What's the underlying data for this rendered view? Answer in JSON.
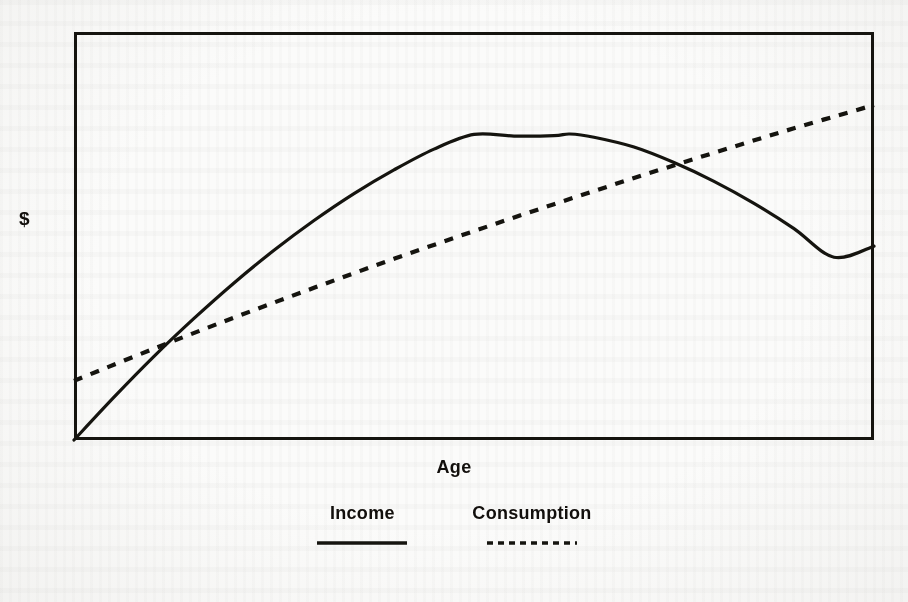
{
  "figure": {
    "background_color": "#fbfbfa",
    "ink_color": "#15140f",
    "frame": {
      "x": 74,
      "y": 32,
      "width": 800,
      "height": 408,
      "border_width": 3
    }
  },
  "axes": {
    "y_label": "$",
    "x_label": "Age"
  },
  "legend": {
    "items": [
      {
        "label": "Income",
        "style": "solid",
        "icon": "solid-line-icon"
      },
      {
        "label": "Consumption",
        "style": "dashed",
        "icon": "dashed-line-icon"
      }
    ]
  },
  "chart_data": {
    "type": "line",
    "title": "",
    "xlabel": "Age",
    "ylabel": "$",
    "grid": false,
    "legend_position": "bottom-center",
    "axis_ticks": {
      "x": [],
      "y": []
    },
    "xlim": [
      0,
      100
    ],
    "ylim": [
      0,
      100
    ],
    "note": "Schematic life-cycle diagram: income is a concave (hump-shaped) curve peaking in middle age; consumption rises smoothly and nearly linearly. Values are unitless schematic positions read off the plot frame (0-100 on each axis).",
    "series": [
      {
        "name": "Income",
        "style": "solid",
        "x": [
          0,
          5,
          10,
          15,
          20,
          25,
          30,
          35,
          40,
          45,
          50,
          55,
          60,
          62,
          65,
          70,
          75,
          80,
          85,
          90,
          95,
          100
        ],
        "y": [
          0,
          10.5,
          20.5,
          29.8,
          38.5,
          46.5,
          53.8,
          60.4,
          66.2,
          71.3,
          74.9,
          74.5,
          74.6,
          75.0,
          74.2,
          71.8,
          68.0,
          63.4,
          58.0,
          51.8,
          44.8,
          47.5
        ]
      },
      {
        "name": "Consumption",
        "style": "dashed",
        "x": [
          0,
          10,
          20,
          30,
          40,
          50,
          60,
          70,
          80,
          90,
          100
        ],
        "y": [
          14.5,
          22.4,
          30.0,
          37.3,
          44.4,
          51.2,
          57.8,
          64.2,
          70.4,
          76.4,
          82.1
        ]
      }
    ],
    "annotations": [
      {
        "text": "lower crossing (consumption meets income)",
        "x": 10.1,
        "y": 22.5
      },
      {
        "text": "income peak",
        "x": 62.0,
        "y": 75.0
      },
      {
        "text": "upper crossing (consumption exceeds income)",
        "x": 71.4,
        "y": 72.8
      }
    ]
  }
}
